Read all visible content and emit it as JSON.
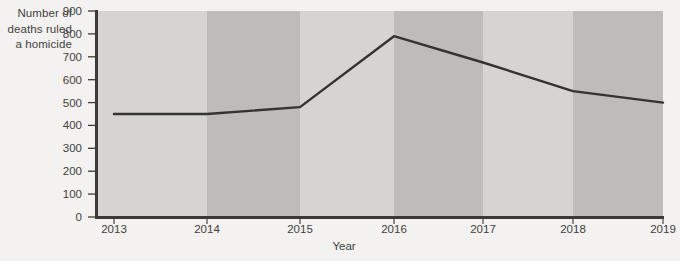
{
  "chart_data": {
    "type": "line",
    "title": "",
    "xlabel": "Year",
    "ylabel": "Number of deaths ruled a homicide",
    "x": [
      2013,
      2014,
      2015,
      2016,
      2017,
      2018,
      2019
    ],
    "values": [
      450,
      450,
      480,
      790,
      675,
      550,
      500
    ],
    "series": [
      {
        "name": "Number of deaths ruled a homicide",
        "values": [
          450,
          450,
          480,
          790,
          675,
          550,
          500
        ]
      }
    ],
    "xtick_labels": [
      "2013",
      "2014",
      "2015",
      "2016",
      "2017",
      "2018",
      "2019"
    ],
    "ytick_labels": [
      "900",
      "800",
      "700",
      "600",
      "500",
      "400",
      "300",
      "200",
      "100",
      "0"
    ],
    "ytick_values": [
      900,
      800,
      700,
      600,
      500,
      400,
      300,
      200,
      100,
      0
    ],
    "xlim": [
      2013,
      2019
    ],
    "ylim": [
      0,
      900
    ],
    "grid": false,
    "legend": false,
    "legend_position": "none",
    "background_bands": "alternating vertical year bands",
    "colors": {
      "page_background": "#f3f2f0",
      "band_light": "#d5d4d2",
      "band_dark": "#bdbcba",
      "line": "#333333",
      "axis": "#3a3a3a",
      "text": "#3f3f3f"
    }
  },
  "axis_titles": {
    "y_line1": "Number of",
    "y_line2": "deaths ruled",
    "y_line3": "a homicide",
    "x": "Year"
  }
}
